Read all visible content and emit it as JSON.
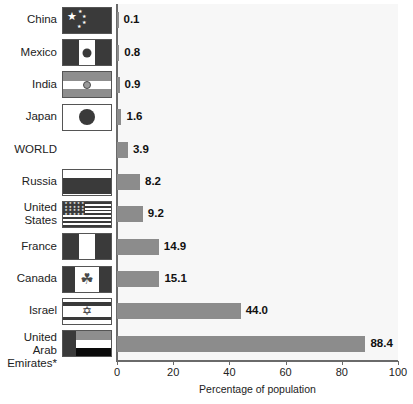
{
  "chart_data": {
    "type": "bar",
    "orientation": "horizontal",
    "title": "",
    "xlabel": "Percentage of population",
    "ylabel": "",
    "xlim": [
      0,
      100
    ],
    "xticks": [
      0,
      20,
      40,
      60,
      80,
      100
    ],
    "xticklabels": [
      "0",
      "20",
      "40",
      "60",
      "80",
      "100"
    ],
    "grid": false,
    "legend": null,
    "bar_color": "#8c8c8c",
    "plot_background": "#f7f7f7",
    "categories": [
      "China",
      "Mexico",
      "India",
      "Japan",
      "WORLD",
      "Russia",
      "United States",
      "France",
      "Canada",
      "Israel",
      "United Arab Emirates*"
    ],
    "values": [
      0.1,
      0.8,
      0.9,
      1.6,
      3.9,
      8.2,
      9.2,
      14.9,
      15.1,
      44.0,
      88.4
    ],
    "value_labels": [
      "0.1",
      "0.8",
      "0.9",
      "1.6",
      "3.9",
      "8.2",
      "9.2",
      "14.9",
      "15.1",
      "44.0",
      "88.4"
    ]
  },
  "rows": [
    {
      "label": "China",
      "value_label": "0.1",
      "value": 0.1,
      "flag": "flag-china"
    },
    {
      "label": "Mexico",
      "value_label": "0.8",
      "value": 0.8,
      "flag": "flag-mexico"
    },
    {
      "label": "India",
      "value_label": "0.9",
      "value": 0.9,
      "flag": "flag-india"
    },
    {
      "label": "Japan",
      "value_label": "1.6",
      "value": 1.6,
      "flag": "flag-japan"
    },
    {
      "label": "WORLD",
      "value_label": "3.9",
      "value": 3.9,
      "flag": null
    },
    {
      "label": "Russia",
      "value_label": "8.2",
      "value": 8.2,
      "flag": "flag-russia"
    },
    {
      "label": "United\nStates",
      "value_label": "9.2",
      "value": 9.2,
      "flag": "flag-united-states"
    },
    {
      "label": "France",
      "value_label": "14.9",
      "value": 14.9,
      "flag": "flag-france"
    },
    {
      "label": "Canada",
      "value_label": "15.1",
      "value": 15.1,
      "flag": "flag-canada"
    },
    {
      "label": "Israel",
      "value_label": "44.0",
      "value": 44.0,
      "flag": "flag-israel"
    },
    {
      "label": "United Arab\nEmirates*",
      "value_label": "88.4",
      "value": 88.4,
      "flag": "flag-uae"
    }
  ],
  "axis": {
    "ticks": [
      "0",
      "20",
      "40",
      "60",
      "80",
      "100"
    ],
    "title": "Percentage of population"
  }
}
